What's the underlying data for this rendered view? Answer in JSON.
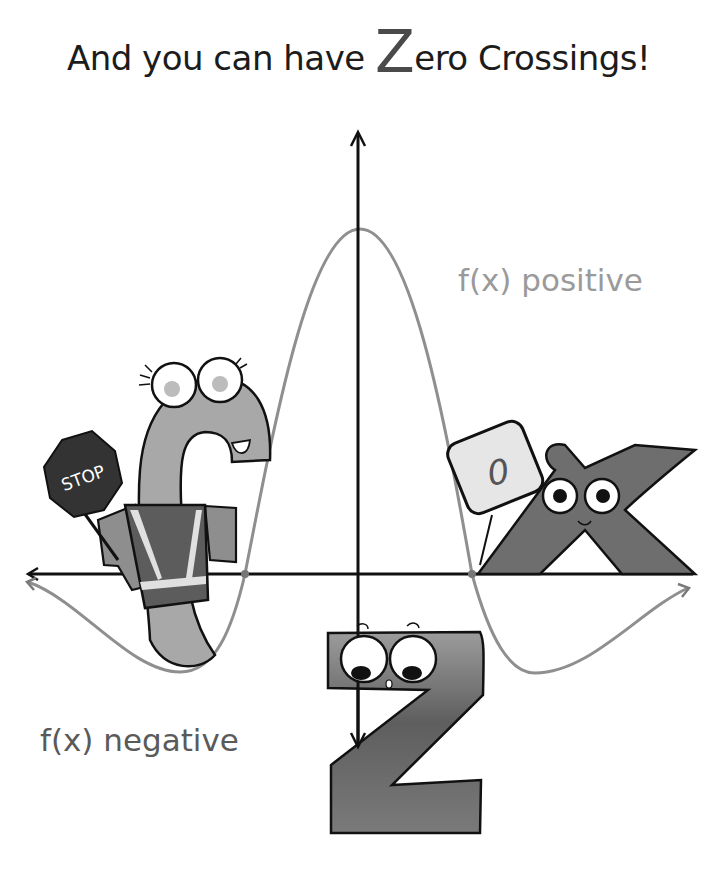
{
  "title": {
    "prefix": "And you can have ",
    "big_letter": "Z",
    "suffix": "ero Crossings!"
  },
  "labels": {
    "positive": "f(x) positive",
    "negative": "f(x) negative"
  },
  "characters": {
    "f": {
      "letter": "f",
      "sign_text": "STOP",
      "props": [
        "stop-sign",
        "safety-vest"
      ]
    },
    "x": {
      "letter": "x",
      "sign_text": "0"
    },
    "z": {
      "letter": "z"
    }
  },
  "graph": {
    "x_axis_y": 574,
    "y_axis_x": 358,
    "curve_peak": [
      360,
      229
    ],
    "zero_crossings": [
      [
        245,
        574
      ],
      [
        472,
        574
      ]
    ],
    "minima": [
      [
        180,
        672
      ],
      [
        535,
        673
      ]
    ]
  },
  "colors": {
    "curve": "#9a9a9a",
    "curve_negative": "#7a7a7a",
    "axis": "#111111",
    "character_fill": "#a8a8a8",
    "x_fill": "#6e6e6e",
    "z_fill": "#7a7a7a",
    "stop_sign": "#333333"
  }
}
